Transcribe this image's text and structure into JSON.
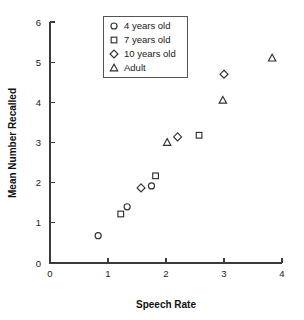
{
  "chart_data": {
    "type": "scatter",
    "title": "",
    "xlabel": "Speech Rate",
    "ylabel": "Mean Number Recalled",
    "xlim": [
      0,
      4
    ],
    "ylim": [
      0,
      6
    ],
    "xticks": [
      "0",
      "1",
      "2",
      "3",
      "4"
    ],
    "yticks": [
      "0",
      "1",
      "2",
      "3",
      "4",
      "5",
      "6"
    ],
    "grid": false,
    "legend_position": "top-center",
    "series": [
      {
        "name": "4 years old",
        "marker": "circle",
        "points": [
          {
            "x": 0.83,
            "y": 0.68
          },
          {
            "x": 1.33,
            "y": 1.4
          },
          {
            "x": 1.75,
            "y": 1.92
          }
        ]
      },
      {
        "name": "7 years old",
        "marker": "square",
        "points": [
          {
            "x": 1.22,
            "y": 1.22
          },
          {
            "x": 1.82,
            "y": 2.17
          },
          {
            "x": 2.57,
            "y": 3.18
          }
        ]
      },
      {
        "name": "10 years old",
        "marker": "diamond",
        "points": [
          {
            "x": 1.57,
            "y": 1.87
          },
          {
            "x": 2.2,
            "y": 3.14
          },
          {
            "x": 3.0,
            "y": 4.7
          }
        ]
      },
      {
        "name": "Adult",
        "marker": "triangle",
        "points": [
          {
            "x": 2.02,
            "y": 3.0
          },
          {
            "x": 2.98,
            "y": 4.05
          },
          {
            "x": 3.83,
            "y": 5.1
          }
        ]
      }
    ]
  },
  "legend": {
    "items": [
      {
        "label": "4 years old",
        "marker": "circle"
      },
      {
        "label": "7 years old",
        "marker": "square"
      },
      {
        "label": "10 years old",
        "marker": "diamond"
      },
      {
        "label": "Adult",
        "marker": "triangle"
      }
    ]
  },
  "colors": {
    "marker_stroke": "#303030",
    "axis": "#3b3b3b",
    "text": "#1a1a1a",
    "background": "#ffffff"
  }
}
